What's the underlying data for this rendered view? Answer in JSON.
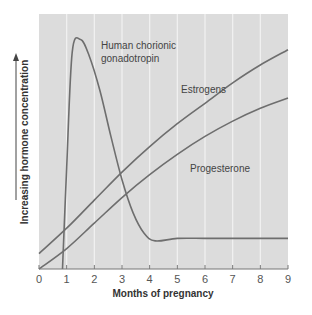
{
  "chart_data": {
    "type": "line",
    "title": "",
    "xlabel": "Months of pregnancy",
    "ylabel": "Increasing hormone concentration",
    "xlim": [
      0,
      9
    ],
    "ylim": [
      0,
      100
    ],
    "x_ticks": [
      "0",
      "1",
      "2",
      "3",
      "4",
      "5",
      "6",
      "7",
      "8",
      "9"
    ],
    "grid": {
      "vertical": true,
      "horizontal": false
    },
    "legend": "inline labels",
    "series": [
      {
        "name": "Human chorionic gonadotropin",
        "label_lines": [
          "Human chorionic",
          "gonadotropin"
        ],
        "x": [
          0.85,
          1.0,
          1.2,
          1.5,
          1.8,
          2.2,
          2.6,
          3.0,
          3.4,
          3.8,
          4.2,
          5.0,
          6.0,
          7.0,
          8.0,
          9.0
        ],
        "values": [
          0,
          40,
          85,
          90,
          84,
          70,
          52,
          35,
          22,
          14,
          11,
          12,
          12,
          12,
          12,
          12
        ]
      },
      {
        "name": "Estrogens",
        "x": [
          0,
          1,
          2,
          3,
          4,
          5,
          6,
          7,
          8,
          9
        ],
        "values": [
          6,
          16,
          27,
          38,
          48,
          57,
          65,
          73,
          80,
          86
        ]
      },
      {
        "name": "Progesterone",
        "x": [
          0,
          1,
          2,
          3,
          4,
          5,
          6,
          7,
          8,
          9
        ],
        "values": [
          0,
          8,
          18,
          28,
          37,
          45,
          52,
          58,
          63,
          67
        ]
      }
    ],
    "colors": {
      "plot_bg": "#dcdcdc",
      "gridline": "#f2f2f2",
      "line": "#6e6e6e",
      "axis": "#777777"
    }
  }
}
